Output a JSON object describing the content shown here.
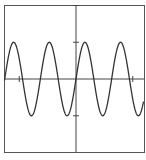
{
  "chart_data": {
    "type": "line",
    "title": "",
    "xlabel": "",
    "ylabel": "",
    "function": "y = sin(10x)",
    "xlim": [
      -1.26,
      1.19
    ],
    "ylim": [
      -2,
      2
    ],
    "x_ticks": [
      -1,
      1
    ],
    "y_ticks": [
      -1,
      1
    ],
    "tick_labels_shown": false,
    "grid": false,
    "legend": null,
    "series": [
      {
        "name": "sin(10x)",
        "x": [
          -1.2,
          -1.0,
          -0.8,
          -0.6,
          -0.4,
          -0.2,
          0.0,
          0.2,
          0.4,
          0.6,
          0.8,
          1.0,
          1.2
        ],
        "values": [
          0.54,
          0.54,
          -0.99,
          0.28,
          0.76,
          -0.91,
          0.0,
          0.91,
          -0.76,
          -0.28,
          0.99,
          -0.54,
          -0.54
        ],
        "color": "#333333"
      }
    ],
    "amplitude": 1,
    "period": 0.628
  },
  "colors": {
    "line": "#333333",
    "axis": "#444444",
    "frame": "#555555",
    "background": "#ffffff"
  }
}
